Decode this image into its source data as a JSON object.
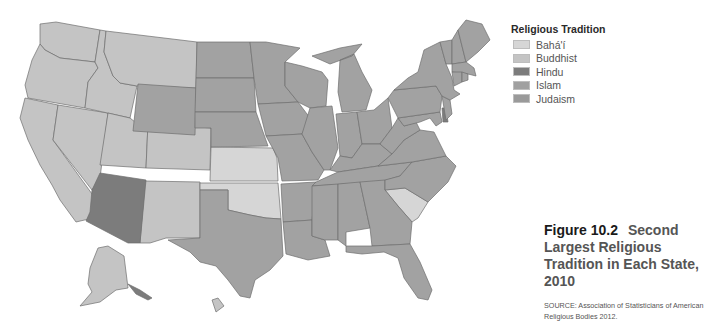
{
  "legend": {
    "title": "Religious Tradition",
    "items": [
      {
        "label": "Bahá'í",
        "color": "#d6d6d6"
      },
      {
        "label": "Buddhist",
        "color": "#c4c4c4"
      },
      {
        "label": "Hindu",
        "color": "#7c7c7c"
      },
      {
        "label": "Islam",
        "color": "#a0a0a0"
      },
      {
        "label": "Judaism",
        "color": "#9a9a9a"
      }
    ]
  },
  "figure": {
    "number": "Figure 10.2",
    "title": "Second Largest Religious Tradition in Each State, 2010",
    "source": "SOURCE: Association of Statisticians of American Religious Bodies 2012."
  },
  "map_data": {
    "Bahá'í": [
      "Kansas",
      "Oklahoma",
      "South Carolina"
    ],
    "Buddhist": [
      "Washington",
      "Oregon",
      "California",
      "Nevada",
      "Idaho",
      "Montana",
      "Utah",
      "Colorado",
      "New Mexico",
      "Alaska",
      "Hawaii"
    ],
    "Hindu": [
      "Arizona",
      "Delaware"
    ],
    "Islam/Judaism": [
      "Wyoming",
      "North Dakota",
      "South Dakota",
      "Nebraska",
      "Minnesota",
      "Iowa",
      "Missouri",
      "Wisconsin",
      "Illinois",
      "Michigan",
      "Indiana",
      "Ohio",
      "Kentucky",
      "Tennessee",
      "Arkansas",
      "Louisiana",
      "Mississippi",
      "Alabama",
      "Georgia",
      "Florida",
      "North Carolina",
      "Virginia",
      "West Virginia",
      "Maryland",
      "Pennsylvania",
      "New York",
      "New Jersey",
      "Connecticut",
      "Rhode Island",
      "Massachusetts",
      "Vermont",
      "New Hampshire",
      "Maine",
      "Texas"
    ]
  }
}
